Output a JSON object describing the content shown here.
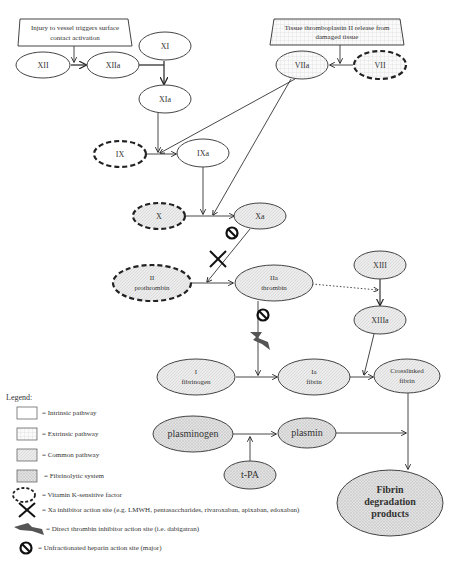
{
  "diagram": {
    "boxes": {
      "intrinsic_trigger": "Injury to vessel triggers surface contact activation",
      "intrinsic_trigger_line1": "Injury to vessel triggers surface",
      "intrinsic_trigger_line2": "contact activation",
      "extrinsic_trigger_line1": "Tissue thromboplastin II release from",
      "extrinsic_trigger_line2": "damaged tissue"
    },
    "nodes": {
      "XII": "XII",
      "XIIa": "XIIa",
      "XI": "XI",
      "XIa": "XIa",
      "VII": "VII",
      "VIIa": "VIIa",
      "IX": "IX",
      "IXa": "IXa",
      "X": "X",
      "Xa": "Xa",
      "II_line1": "II",
      "II_line2": "prothrombin",
      "IIa_line1": "IIa",
      "IIa_line2": "thrombin",
      "XIII": "XIII",
      "XIIIa": "XIIIa",
      "I_line1": "I",
      "I_line2": "fibrinogen",
      "Ia_line1": "Ia",
      "Ia_line2": "fibrin",
      "crosslinked_line1": "Crosslinked",
      "crosslinked_line2": "fibrin",
      "plasminogen": "plasminogen",
      "plasmin": "plasmin",
      "tPA": "t-PA",
      "fdp_line1": "Fibrin",
      "fdp_line2": "degradation",
      "fdp_line3": "products"
    }
  },
  "legend": {
    "title": "Legend:",
    "items": [
      {
        "label": "= Intrinsic pathway"
      },
      {
        "label": "= Extrinsic pathway"
      },
      {
        "label": "= Common pathway"
      },
      {
        "label": "= Fibrinolytic system"
      },
      {
        "label": "= Vitamin K-sensitive factor"
      },
      {
        "label": "= Xa inhibitor action site (e.g. LMWH, pentasaccharides, rivaroxaban, apixaban, edoxaban)"
      },
      {
        "label": "= Direct thrombin inhibitor action site (i.e. dabigatran)"
      },
      {
        "label": "= Unfractionated heparin action site (major)"
      }
    ]
  },
  "colors": {
    "intrinsic_fill": "#ffffff",
    "extrinsic_fill": "#f4f4f4",
    "common_fill": "#e6e6e6",
    "fibrinolytic_fill": "#dcdcdc",
    "stroke": "#333333"
  }
}
